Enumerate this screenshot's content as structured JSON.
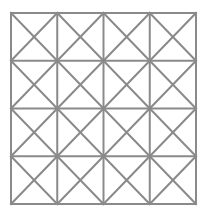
{
  "diagram": {
    "type": "square-grid-with-diagonals",
    "rows": 4,
    "cols": 4,
    "origin": {
      "x": 11,
      "y": 13
    },
    "size": {
      "width": 185,
      "height": 191
    },
    "line_color": "#8a8a8a",
    "line_width": 2,
    "background": "#ffffff",
    "diagonals_per_cell": [
      "top-left-to-bottom-right",
      "top-right-to-bottom-left"
    ]
  }
}
